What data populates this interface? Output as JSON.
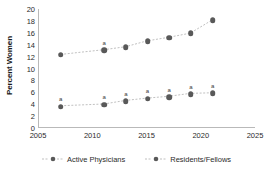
{
  "chart_data": {
    "type": "line",
    "title": "",
    "subtitle": "",
    "xlabel": "",
    "ylabel": "Percent Women",
    "xlim": [
      2005,
      2025
    ],
    "ylim": [
      0,
      20
    ],
    "xticks": [
      "2005",
      "2010",
      "2015",
      "2020",
      "2025"
    ],
    "xtick_values": [
      2005,
      2010,
      2015,
      2020,
      2025
    ],
    "yticks": [
      "0",
      "2",
      "4",
      "6",
      "8",
      "10",
      "12",
      "14",
      "16",
      "18",
      "20"
    ],
    "ytick_values": [
      0,
      2,
      4,
      6,
      8,
      10,
      12,
      14,
      16,
      18,
      20
    ],
    "grid": false,
    "legend_position": "bottom",
    "marker_color": "#595959",
    "line_color": "#bfbfbf",
    "axis_color": "#b9b9b9",
    "annotation_label": "a",
    "x": [
      2007,
      2011,
      2013,
      2015,
      2017,
      2019,
      2021
    ],
    "series": [
      {
        "name": "Active Physicians",
        "values": [
          3.6,
          3.9,
          4.5,
          4.9,
          5.2,
          5.7,
          5.8
        ],
        "annotations": [
          "a",
          "a",
          "a",
          "a",
          "a",
          "a",
          "a"
        ]
      },
      {
        "name": "Residents/Fellows",
        "values": [
          12.3,
          13.1,
          13.6,
          14.6,
          15.2,
          15.9,
          18.1
        ],
        "annotations": [
          "",
          "a",
          "",
          "",
          "",
          "",
          ""
        ]
      }
    ]
  },
  "legend": {
    "items": [
      {
        "label": "Active Physicians"
      },
      {
        "label": "Residents/Fellows"
      }
    ]
  }
}
